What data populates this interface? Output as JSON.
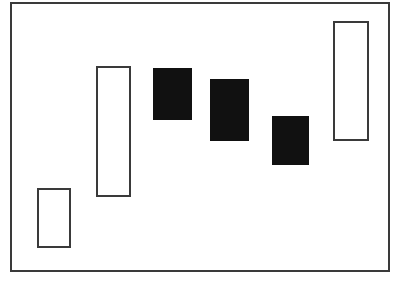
{
  "figure": {
    "title": "",
    "background_color": "#ffffff",
    "width": 398,
    "height": 283
  },
  "frame": {
    "name": "plot-border",
    "x": 10,
    "y": 2,
    "width": 380,
    "height": 270,
    "stroke_color": "#3a3a3a",
    "stroke_width": 2,
    "fill_color": "#ffffff"
  },
  "chart_data": {
    "type": "bar",
    "title": "",
    "subtitle": "",
    "xlabel": "",
    "ylabel": "",
    "xlim": [
      0,
      380
    ],
    "ylim": [
      0,
      270
    ],
    "grid": false,
    "legend": null,
    "axis_visible": false,
    "tick_labels_x": [],
    "tick_labels_y": [],
    "annotations": [],
    "orientation": "vertical",
    "categories": [
      "1",
      "2",
      "3",
      "4",
      "5",
      "6"
    ],
    "series": [
      {
        "name": "range-bars",
        "values": [
          60,
          131,
          52,
          62,
          49,
          120
        ]
      }
    ],
    "bars": [
      {
        "index": 0,
        "label": "bar-1",
        "style": "hollow",
        "x": 37,
        "y": 188,
        "width": 34,
        "height": 60,
        "top": 188,
        "bottom": 248,
        "left": 37,
        "right": 71,
        "fill_color": "#ffffff",
        "stroke_color": "#3a3a3a",
        "stroke_width": 2
      },
      {
        "index": 1,
        "label": "bar-2",
        "style": "hollow",
        "x": 96,
        "y": 66,
        "width": 35,
        "height": 131,
        "top": 66,
        "bottom": 197,
        "left": 96,
        "right": 131,
        "fill_color": "#ffffff",
        "stroke_color": "#3a3a3a",
        "stroke_width": 2
      },
      {
        "index": 2,
        "label": "bar-3",
        "style": "filled",
        "x": 153,
        "y": 68,
        "width": 39,
        "height": 52,
        "top": 68,
        "bottom": 120,
        "left": 153,
        "right": 192,
        "fill_color": "#111111",
        "stroke_color": "#111111",
        "stroke_width": 1
      },
      {
        "index": 3,
        "label": "bar-4",
        "style": "filled",
        "x": 210,
        "y": 79,
        "width": 39,
        "height": 62,
        "top": 79,
        "bottom": 141,
        "left": 210,
        "right": 249,
        "fill_color": "#111111",
        "stroke_color": "#111111",
        "stroke_width": 1
      },
      {
        "index": 4,
        "label": "bar-5",
        "style": "filled",
        "x": 272,
        "y": 116,
        "width": 37,
        "height": 49,
        "top": 116,
        "bottom": 165,
        "left": 272,
        "right": 309,
        "fill_color": "#111111",
        "stroke_color": "#111111",
        "stroke_width": 1
      },
      {
        "index": 5,
        "label": "bar-6",
        "style": "hollow",
        "x": 333,
        "y": 21,
        "width": 36,
        "height": 120,
        "top": 21,
        "bottom": 141,
        "left": 333,
        "right": 369,
        "fill_color": "#ffffff",
        "stroke_color": "#3a3a3a",
        "stroke_width": 2
      }
    ]
  }
}
